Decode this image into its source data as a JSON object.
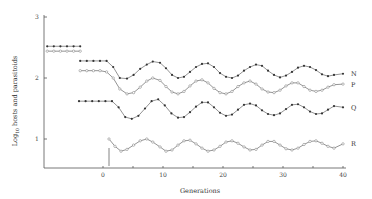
{
  "chart_data": {
    "type": "line",
    "title": "",
    "xlabel": "Generations",
    "ylabel": "Log10 hosts and parasitoids",
    "ylabel_main": "Log",
    "ylabel_sub": "10",
    "ylabel_rest": " hosts and parasitoids",
    "xlim": [
      -10,
      40
    ],
    "ylim": [
      0.5,
      3
    ],
    "x_ticks": [
      0,
      10,
      20,
      30,
      40
    ],
    "x_tick_labels": [
      "0",
      "10",
      "20",
      "30",
      "40"
    ],
    "y_ticks": [
      1,
      2,
      3
    ],
    "y_tick_labels": [
      "1",
      "2",
      "3"
    ],
    "grid": false,
    "legend": "inline labels at right end of each series",
    "annotation": "vertical marker at generation 1",
    "series": [
      {
        "name": "N",
        "marker": "filled",
        "segments": [
          {
            "x": [
              -9.3,
              -8.2,
              -7.1,
              -6,
              -4.9,
              -3.8
            ],
            "y": [
              2.52,
              2.52,
              2.52,
              2.52,
              2.52,
              2.52
            ]
          },
          {
            "x": [
              -3.8,
              -2.7,
              -1.6,
              -0.5,
              0.6,
              1.7,
              2.8,
              4,
              5.1,
              6.2,
              7.3,
              8.3,
              9.5,
              10.5,
              11.5,
              12.5,
              13.5,
              14.5,
              15.5,
              16.5,
              17.5,
              18.5,
              19.5,
              20.5,
              21.5,
              22.5,
              23.5,
              24.5,
              25.5,
              26.5,
              27.5,
              28.5,
              29.5,
              30.5,
              31.5,
              32.5,
              33.5,
              34.5,
              35.5,
              36.5,
              37.5,
              38.5,
              40
            ],
            "y": [
              2.28,
              2.28,
              2.28,
              2.28,
              2.28,
              2.18,
              2.0,
              1.99,
              2.05,
              2.15,
              2.22,
              2.27,
              2.25,
              2.16,
              2.05,
              2.0,
              2.02,
              2.1,
              2.18,
              2.23,
              2.24,
              2.18,
              2.08,
              2.02,
              2.0,
              2.04,
              2.12,
              2.18,
              2.22,
              2.2,
              2.12,
              2.05,
              2.01,
              2.04,
              2.1,
              2.17,
              2.2,
              2.18,
              2.13,
              2.06,
              2.03,
              2.05,
              2.07
            ]
          }
        ]
      },
      {
        "name": "P",
        "marker": "open",
        "segments": [
          {
            "x": [
              -9.3,
              -8.2,
              -7.1,
              -6,
              -4.9,
              -3.8
            ],
            "y": [
              2.44,
              2.44,
              2.44,
              2.44,
              2.44,
              2.44
            ]
          },
          {
            "x": [
              -3.8,
              -2.7,
              -1.6,
              -0.5,
              0.6,
              1.7,
              2.8,
              4,
              5.1,
              6.2,
              7.3,
              8.3,
              9.5,
              10.5,
              11.5,
              12.5,
              13.5,
              14.5,
              15.5,
              16.5,
              17.5,
              18.5,
              19.5,
              20.5,
              21.5,
              22.5,
              23.5,
              24.5,
              25.5,
              26.5,
              27.5,
              28.5,
              29.5,
              30.5,
              31.5,
              32.5,
              33.5,
              34.5,
              35.5,
              36.5,
              37.5,
              38.5,
              40
            ],
            "y": [
              2.12,
              2.12,
              2.12,
              2.12,
              2.1,
              2.0,
              1.82,
              1.74,
              1.76,
              1.85,
              1.95,
              2.0,
              1.96,
              1.86,
              1.77,
              1.74,
              1.78,
              1.87,
              1.95,
              1.97,
              1.92,
              1.83,
              1.76,
              1.74,
              1.78,
              1.86,
              1.92,
              1.95,
              1.9,
              1.82,
              1.77,
              1.76,
              1.8,
              1.87,
              1.92,
              1.92,
              1.86,
              1.8,
              1.78,
              1.8,
              1.85,
              1.89,
              1.9
            ]
          }
        ]
      },
      {
        "name": "Q",
        "marker": "filled",
        "segments": [
          {
            "x": [
              -4,
              -2.9,
              -1.8,
              -0.7,
              0.4,
              1.5,
              2.6,
              3.7,
              4.8,
              5.9,
              7,
              8.1,
              9.2,
              10.3,
              11.4,
              12.5,
              13.5,
              14.5,
              15.5,
              16.5,
              17.5,
              18.5,
              19.5,
              20.5,
              21.5,
              22.5,
              23.5,
              24.5,
              25.5,
              26.5,
              27.5,
              28.5,
              29.5,
              30.5,
              31.5,
              32.5,
              33.5,
              34.5,
              35.5,
              36.5,
              37.5,
              38.5,
              40
            ],
            "y": [
              1.62,
              1.62,
              1.62,
              1.62,
              1.62,
              1.62,
              1.52,
              1.36,
              1.33,
              1.38,
              1.5,
              1.62,
              1.65,
              1.55,
              1.42,
              1.35,
              1.36,
              1.44,
              1.53,
              1.6,
              1.6,
              1.52,
              1.43,
              1.38,
              1.4,
              1.48,
              1.56,
              1.58,
              1.55,
              1.47,
              1.41,
              1.39,
              1.42,
              1.49,
              1.56,
              1.57,
              1.52,
              1.45,
              1.41,
              1.42,
              1.48,
              1.54,
              1.52
            ]
          }
        ]
      },
      {
        "name": "R",
        "marker": "open",
        "segments": [
          {
            "x": [
              1,
              2,
              3,
              4,
              5.1,
              6.2,
              7.3,
              8.3,
              9.5,
              10.5,
              11.5,
              12.5,
              13.5,
              14.5,
              15.5,
              16.5,
              17.5,
              18.5,
              19.5,
              20.5,
              21.5,
              22.5,
              23.5,
              24.5,
              25.5,
              26.5,
              27.5,
              28.5,
              29.5,
              30.5,
              31.5,
              32.5,
              33.5,
              34.5,
              35.5,
              36.5,
              37.5,
              38.5,
              40
            ],
            "y": [
              1.0,
              0.88,
              0.8,
              0.83,
              0.9,
              0.97,
              1.0,
              0.95,
              0.87,
              0.8,
              0.82,
              0.9,
              0.97,
              0.98,
              0.92,
              0.85,
              0.8,
              0.82,
              0.88,
              0.95,
              0.97,
              0.93,
              0.87,
              0.82,
              0.83,
              0.9,
              0.96,
              0.96,
              0.9,
              0.84,
              0.82,
              0.85,
              0.91,
              0.96,
              0.97,
              0.93,
              0.88,
              0.85,
              0.92
            ]
          }
        ]
      }
    ]
  }
}
